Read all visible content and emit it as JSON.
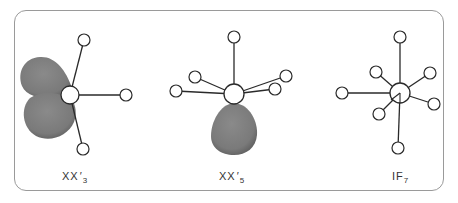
{
  "colors": {
    "lobe": "#7d7d7d",
    "lobe_edge": "#5e5e5e",
    "bond": "#2a2a2a",
    "atom_stroke": "#2a2a2a",
    "frame": "#9a9a9a"
  },
  "molecules": [
    {
      "id": "xx3",
      "label": {
        "main": "XX",
        "prime": "′",
        "sub": "3"
      },
      "center_atom": {
        "x": 70,
        "y": 95,
        "r": 9
      },
      "ligands": [
        {
          "x": 84,
          "y": 40,
          "r": 6
        },
        {
          "x": 126,
          "y": 95,
          "r": 6
        },
        {
          "x": 83,
          "y": 149,
          "r": 6
        }
      ],
      "lone_pairs": 2
    },
    {
      "id": "xx5",
      "label": {
        "main": "XX",
        "prime": "′",
        "sub": "5"
      },
      "center_atom": {
        "x": 234,
        "y": 94,
        "r": 10
      },
      "ligands": [
        {
          "x": 234,
          "y": 37,
          "r": 6
        },
        {
          "x": 195,
          "y": 77,
          "r": 6
        },
        {
          "x": 176,
          "y": 91,
          "r": 6
        },
        {
          "x": 286,
          "y": 76,
          "r": 6
        },
        {
          "x": 275,
          "y": 89,
          "r": 6
        }
      ],
      "lone_pairs": 1
    },
    {
      "id": "if7",
      "label": {
        "main": "IF",
        "prime": "",
        "sub": "7"
      },
      "center_atom": {
        "x": 400,
        "y": 93,
        "r": 10
      },
      "ligands": [
        {
          "x": 400,
          "y": 37,
          "r": 6
        },
        {
          "x": 398,
          "y": 148,
          "r": 6
        },
        {
          "x": 342,
          "y": 93,
          "r": 6
        },
        {
          "x": 376,
          "y": 72,
          "r": 6
        },
        {
          "x": 430,
          "y": 73,
          "r": 6
        },
        {
          "x": 434,
          "y": 104,
          "r": 6
        },
        {
          "x": 379,
          "y": 114,
          "r": 6
        }
      ],
      "lone_pairs": 0
    }
  ]
}
